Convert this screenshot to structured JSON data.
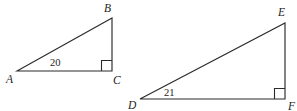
{
  "figure": {
    "background_color": "#ffffff",
    "stroke_color": "#2b2b2b",
    "text_color": "#1d1d1d"
  },
  "shapes": [
    {
      "name": "triangle-abc",
      "vertices": {
        "A": {
          "label": "A",
          "x": 17,
          "y": 71
        },
        "B": {
          "label": "B",
          "x": 112,
          "y": 18
        },
        "C": {
          "label": "C",
          "x": 112,
          "y": 71
        }
      },
      "label_positions": {
        "A": {
          "x": 6,
          "y": 83
        },
        "B": {
          "x": 104,
          "y": 12
        },
        "C": {
          "x": 113,
          "y": 84
        }
      },
      "right_angle_at": "C",
      "angle_measure": {
        "at_vertex": "A",
        "value": "20",
        "x": 50,
        "y": 66
      }
    },
    {
      "name": "triangle-def",
      "vertices": {
        "D": {
          "label": "D",
          "x": 140,
          "y": 99
        },
        "E": {
          "label": "E",
          "x": 285,
          "y": 23
        },
        "F": {
          "label": "F",
          "x": 285,
          "y": 99
        }
      },
      "label_positions": {
        "D": {
          "x": 128,
          "y": 109
        },
        "E": {
          "x": 278,
          "y": 16
        },
        "F": {
          "x": 288,
          "y": 110
        }
      },
      "right_angle_at": "F",
      "angle_measure": {
        "at_vertex": "D",
        "value": "21",
        "x": 164,
        "y": 96
      }
    }
  ]
}
